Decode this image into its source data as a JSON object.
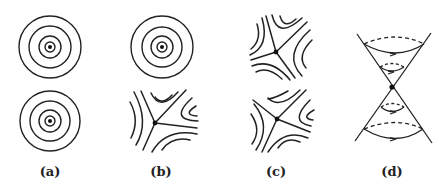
{
  "figure": {
    "panels": [
      {
        "id": "a",
        "label": "(a)",
        "x": 50,
        "top": "center",
        "bottom": "center"
      },
      {
        "id": "b",
        "label": "(b)",
        "x": 161,
        "top": "center",
        "bottom": "saddle"
      },
      {
        "id": "c",
        "label": "(c)",
        "x": 276,
        "top": "saddle",
        "bottom": "saddle"
      },
      {
        "id": "d",
        "label": "(d)",
        "x": 392,
        "type": "double-cone"
      }
    ],
    "colors": {
      "stroke": "#222222",
      "background": "#ffffff"
    }
  }
}
